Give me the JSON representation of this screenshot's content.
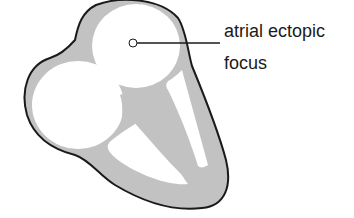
{
  "diagram": {
    "annotation": {
      "line1": "atrial ectopic",
      "line2": "focus"
    },
    "colors": {
      "wall_fill": "#c2c2c2",
      "outline": "#1a1a1a",
      "chamber": "#ffffff"
    }
  }
}
